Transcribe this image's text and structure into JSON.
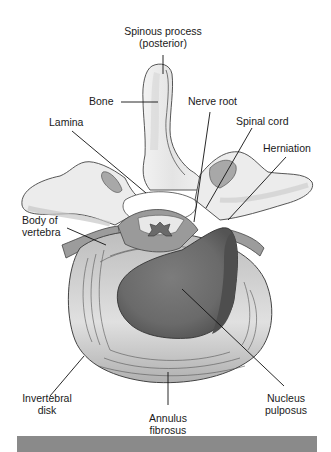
{
  "diagram": {
    "colors": {
      "background": "#ffffff",
      "bone_light": "#ececec",
      "bone_mid": "#d2d2d2",
      "disk_outer": "#c4c4c4",
      "disk_inner_light": "#e2e2e2",
      "nucleus": "#6e6e6e",
      "nucleus_dark": "#4e4e4e",
      "cord": "#9a9a9a",
      "leader_line": "#111111",
      "footer_bar": "#8a8a8a"
    },
    "labels": {
      "spinous_process": "Spinous process",
      "spinous_process_sub": "(posterior)",
      "bone": "Bone",
      "nerve_root": "Nerve root",
      "lamina": "Lamina",
      "spinal_cord": "Spinal cord",
      "herniation": "Herniation",
      "body_of_vertebra_1": "Body of",
      "body_of_vertebra_2": "vertebra",
      "invertebral_disk_1": "Invertebral",
      "invertebral_disk_2": "disk",
      "annulus_fibrosus_1": "Annulus",
      "annulus_fibrosus_2": "fibrosus",
      "nucleus_pulposus_1": "Nucleus",
      "nucleus_pulposus_2": "pulposus"
    }
  }
}
